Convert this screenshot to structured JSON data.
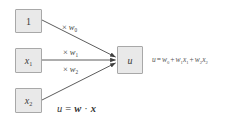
{
  "colors": {
    "box_fill": "#e9e9e9",
    "box_border": "#a8a8a8",
    "arrow": "#4a4a4a",
    "text": "#3b3b3b"
  },
  "nodes": {
    "bias": {
      "label": "1"
    },
    "x1": {
      "base": "x",
      "sub": "1"
    },
    "x2": {
      "base": "x",
      "sub": "2"
    },
    "u": {
      "label": "u"
    }
  },
  "edge_labels": {
    "w0": {
      "times": "×",
      "base": "w",
      "sub": "0"
    },
    "w1": {
      "times": "×",
      "base": "w",
      "sub": "1"
    },
    "w2": {
      "times": "×",
      "base": "w",
      "sub": "2"
    }
  },
  "equations": {
    "expanded": {
      "lhs": "u",
      "eq": "=",
      "w0": "w",
      "s0": "0",
      "plus1": "+",
      "w1": "w",
      "s1": "1",
      "x1": "x",
      "sx1": "1",
      "plus2": "+",
      "w2": "w",
      "s2": "2",
      "x2": "x",
      "sx2": "2"
    },
    "vector": {
      "lhs": "u",
      "eq": "=",
      "w": "w",
      "dot": "·",
      "x": "x"
    }
  }
}
